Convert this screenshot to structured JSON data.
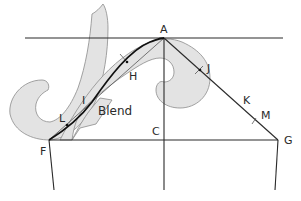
{
  "diagram": {
    "labels": {
      "A": "A",
      "C": "C",
      "F": "F",
      "G": "G",
      "H": "H",
      "I": "I",
      "J": "J",
      "K": "K",
      "L": "L",
      "M": "M",
      "blend": "Blend"
    },
    "colors": {
      "curve_fill": "#e3e3e3",
      "curve_outline": "#8c8c8c",
      "line": "#2a2a2a",
      "blend_curve": "#111111",
      "background": "#ffffff"
    }
  }
}
